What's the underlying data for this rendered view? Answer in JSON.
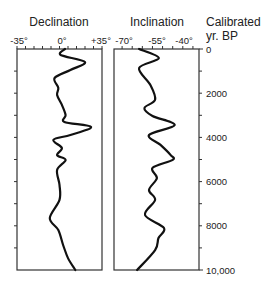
{
  "chart_data": [
    {
      "type": "line",
      "title": "Declination",
      "xlabel": "Declination",
      "ylabel": "Calibrated yr. BP",
      "xlim": [
        -35,
        35
      ],
      "ylim": [
        0,
        10000
      ],
      "x_ticks": [
        "-35°",
        "0°",
        "+35°"
      ],
      "y_ticks": [
        "0",
        "2000",
        "4000",
        "6000",
        "8000",
        "10,000"
      ],
      "orientation": "vertical-depth",
      "grid": false,
      "series": [
        {
          "name": "Declination",
          "age": [
            0,
            270,
            590,
            950,
            1310,
            1760,
            2080,
            2530,
            2990,
            3300,
            3530,
            3890,
            4110,
            4480,
            4800,
            5020,
            5470,
            6150,
            6830,
            7650,
            8190,
            8870,
            9460,
            10000
          ],
          "values": [
            4.5,
            1,
            21,
            9,
            -4,
            -1,
            -2,
            2,
            5,
            4,
            26,
            9,
            -5,
            2,
            -2,
            5,
            -2,
            0,
            0,
            -8,
            -1,
            3,
            7,
            13
          ]
        }
      ]
    },
    {
      "type": "line",
      "title": "Inclination",
      "xlabel": "Inclination",
      "ylabel": "Calibrated yr. BP",
      "xlim": [
        -74,
        -32
      ],
      "ylim": [
        0,
        10000
      ],
      "x_ticks": [
        "-70°",
        "-55°",
        "-40°"
      ],
      "y_ticks": [
        "0",
        "2000",
        "4000",
        "6000",
        "8000",
        "10,000"
      ],
      "orientation": "vertical-depth",
      "grid": false,
      "series": [
        {
          "name": "Inclination",
          "age": [
            0,
            410,
            860,
            1630,
            2300,
            2670,
            3030,
            3440,
            3890,
            4340,
            4800,
            5020,
            5380,
            5840,
            6380,
            6830,
            7510,
            8100,
            8550,
            9100,
            10000
          ],
          "values": [
            -61.6,
            -51.8,
            -61.6,
            -56,
            -53.7,
            -59,
            -55,
            -44,
            -56.7,
            -51,
            -46,
            -45,
            -55,
            -52.8,
            -56.7,
            -53.7,
            -58.7,
            -49.3,
            -52,
            -53.7,
            -62.6
          ]
        }
      ]
    }
  ],
  "labels": {
    "declination_title": "Declination",
    "inclination_title": "Inclination",
    "age_title_line1": "Calibrated",
    "age_title_line2": "yr. BP",
    "dec_ticks": [
      "-35°",
      "0°",
      "+35°"
    ],
    "inc_ticks": [
      "-70°",
      "-55°",
      "-40°"
    ],
    "age_ticks": [
      "0",
      "2000",
      "4000",
      "6000",
      "8000",
      "10,000"
    ]
  },
  "colors": {
    "line": "#111111",
    "axis": "#333333",
    "text": "#222222"
  }
}
